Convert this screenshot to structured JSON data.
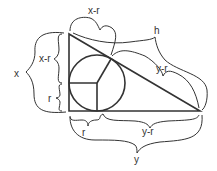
{
  "diagram": {
    "labels": {
      "x": "x",
      "x_minus_r_left": "x-r",
      "r_left": "r",
      "x_minus_r_top": "x-r",
      "h": "h",
      "y_minus_r_hyp": "y-r",
      "r_bottom": "r",
      "y_minus_r_bottom": "y-r",
      "y": "y"
    },
    "colors": {
      "stroke": "#333333",
      "background": "#ffffff"
    }
  }
}
